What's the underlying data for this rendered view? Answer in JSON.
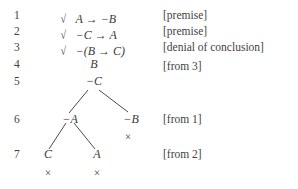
{
  "proof": {
    "type": "semantic-tableau",
    "background_color": "#ffffff",
    "text_color": "#3a3a3a",
    "check_glyph": "√",
    "closure_glyph": "×",
    "arrow_glyph": "→",
    "negation_glyph": "−",
    "rows": [
      {
        "number": "1",
        "checked": true,
        "formula": "A → −B",
        "justification": "[premise]"
      },
      {
        "number": "2",
        "checked": true,
        "formula": "−C → A",
        "justification": "[premise]"
      },
      {
        "number": "3",
        "checked": true,
        "formula": "−(B → C)",
        "justification": "[denial of conclusion]"
      },
      {
        "number": "4",
        "checked": false,
        "formula": "B",
        "justification": "[from 3]"
      },
      {
        "number": "5",
        "checked": false,
        "formula": "−C",
        "justification": ""
      },
      {
        "number": "6",
        "checked": false,
        "formula": "",
        "justification": "[from 1]"
      },
      {
        "number": "7",
        "checked": false,
        "formula": "",
        "justification": "[from 2]"
      }
    ],
    "tree_nodes": [
      {
        "id": "b",
        "label": "B",
        "row": "4"
      },
      {
        "id": "not-c",
        "label": "−C",
        "row": "5"
      },
      {
        "id": "not-a",
        "label": "−A",
        "row": "6"
      },
      {
        "id": "not-b",
        "label": "−B",
        "row": "6"
      },
      {
        "id": "c",
        "label": "C",
        "row": "7"
      },
      {
        "id": "a",
        "label": "A",
        "row": "7"
      }
    ],
    "closures": [
      {
        "under": "not-b",
        "mark": "×"
      },
      {
        "under": "c",
        "mark": "×"
      },
      {
        "under": "a",
        "mark": "×"
      }
    ]
  }
}
